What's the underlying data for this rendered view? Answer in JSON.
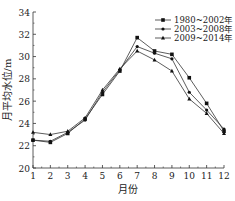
{
  "chart_data": {
    "type": "line",
    "title": "",
    "xlabel": "月份",
    "ylabel": "月平均水位/m",
    "x": [
      1,
      2,
      3,
      4,
      5,
      6,
      7,
      8,
      9,
      10,
      11,
      12
    ],
    "xlim": [
      1,
      12
    ],
    "ylim": [
      20,
      34
    ],
    "yticks": [
      20,
      22,
      24,
      26,
      28,
      30,
      32,
      34
    ],
    "xticks": [
      1,
      2,
      3,
      4,
      5,
      6,
      7,
      8,
      9,
      10,
      11,
      12
    ],
    "grid": false,
    "legend_position": "upper right",
    "series": [
      {
        "name": "1980~2002年",
        "marker": "square",
        "values": [
          22.5,
          22.3,
          23.1,
          24.4,
          26.6,
          28.7,
          31.7,
          30.5,
          30.2,
          28.1,
          25.8,
          23.3
        ]
      },
      {
        "name": "2003~2008年",
        "marker": "circle",
        "values": [
          22.5,
          22.4,
          23.2,
          24.3,
          26.8,
          28.8,
          30.9,
          30.3,
          29.8,
          26.8,
          25.2,
          23.5
        ]
      },
      {
        "name": "2009~2014年",
        "marker": "triangle",
        "values": [
          23.2,
          23.0,
          23.3,
          24.5,
          27.0,
          28.9,
          30.5,
          29.7,
          28.7,
          26.2,
          24.9,
          23.1
        ]
      }
    ]
  }
}
